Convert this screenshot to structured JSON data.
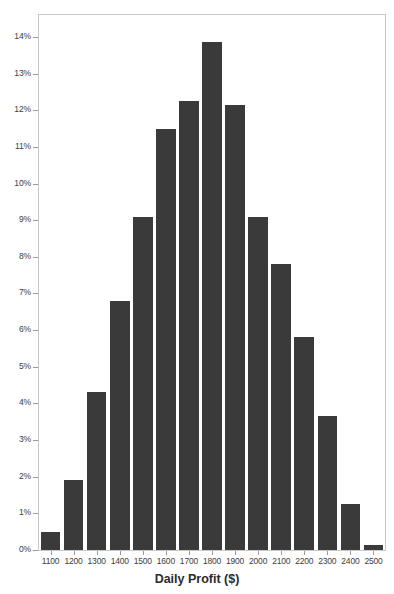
{
  "chart_data": {
    "type": "bar",
    "title": "",
    "subtitle": "",
    "xlabel": "Daily Profit ($)",
    "ylabel": "",
    "grid": false,
    "legend": null,
    "legend_position": "none",
    "bar_color": "#3a3a3a",
    "axis_color": "#c9c9c9",
    "tick_color": "#9a9a9a",
    "text_color": "#3d3d3d",
    "background": "#ffffff",
    "ylim": [
      0,
      14.6
    ],
    "ytick_values": [
      0,
      1,
      2,
      3,
      4,
      5,
      6,
      7,
      8,
      9,
      10,
      11,
      12,
      13,
      14
    ],
    "ytick_labels": [
      "0%",
      "1%",
      "2%",
      "3%",
      "4%",
      "5%",
      "6%",
      "7%",
      "8%",
      "9%",
      "10%",
      "11%",
      "12%",
      "13%",
      "14%"
    ],
    "categories": [
      "1100",
      "1200",
      "1300",
      "1400",
      "1500",
      "1600",
      "1700",
      "1800",
      "1900",
      "2000",
      "2100",
      "2200",
      "2300",
      "2400",
      "2500"
    ],
    "values": [
      0.5,
      1.9,
      4.3,
      6.8,
      9.1,
      11.5,
      12.25,
      13.85,
      12.15,
      9.1,
      7.8,
      5.8,
      3.65,
      1.25,
      0.15
    ],
    "value_unit": "%"
  }
}
